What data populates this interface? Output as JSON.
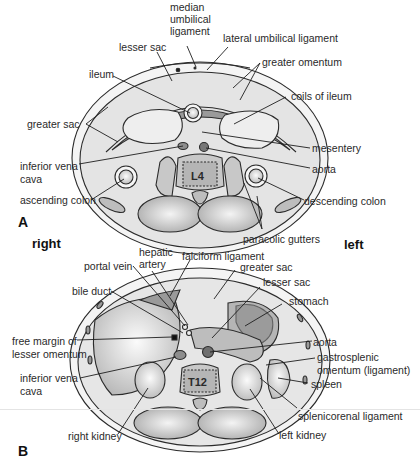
{
  "figure": {
    "panels": [
      {
        "letter": "A",
        "vertebra": "L4",
        "labels": {
          "median_umbilical_ligament": [
            "median",
            "umbilical",
            "ligament"
          ],
          "lateral_umbilical_ligament": "lateral umbilical ligament",
          "lesser_sac": "lesser sac",
          "greater_omentum": "greater omentum",
          "ileum": "ileum",
          "coils_of_ileum": "coils of ileum",
          "greater_sac": "greater sac",
          "mesentery": "mesentery",
          "inferior_vena_cava": [
            "inferior vena",
            "cava"
          ],
          "aorta": "aorta",
          "ascending_colon": "ascending colon",
          "descending_colon": "descending colon",
          "paracolic_gutters": "paracolic gutters"
        }
      },
      {
        "letter": "B",
        "vertebra": "T12",
        "labels": {
          "hepatic_artery": [
            "hepatic",
            "artery"
          ],
          "portal_vein": "portal vein",
          "falciform_ligament": "falciform ligament",
          "greater_sac": "greater sac",
          "lesser_sac": "lesser sac",
          "bile_duct": "bile duct",
          "stomach": "stomach",
          "free_margin_lesser_omentum": [
            "free margin of",
            "lesser omentum"
          ],
          "aorta": "aorta",
          "gastrosplenic_omentum": [
            "gastrosplenic",
            "omentum (ligament)"
          ],
          "inferior_vena_cava": [
            "inferior vena",
            "cava"
          ],
          "spleen": "spleen",
          "splenicorenal_ligament": "splenicorenal ligament",
          "right_kidney": "right kidney",
          "left_kidney": "left kidney"
        }
      }
    ],
    "orientation": {
      "right": "right",
      "left": "left"
    },
    "colors": {
      "outline": "#2b2b2b",
      "fill_light": "#e9e9e9",
      "fill_mid": "#c8c8c8",
      "fill_dark": "#9a9a9a",
      "leader": "#1e1e1e"
    }
  }
}
